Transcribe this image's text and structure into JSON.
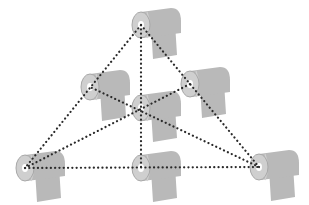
{
  "diagram": {
    "title": "",
    "colors": {
      "background": "#ffffff",
      "roll": "#b9b9b9",
      "roll_edge": "#a8a8a8",
      "roll_face": "#cfcfcf",
      "core": "#ffffff",
      "dots": "#2a2a2a"
    },
    "nodes": [
      {
        "id": "top",
        "role": "vertex",
        "x": 141,
        "y": 25
      },
      {
        "id": "left-mid",
        "role": "midpoint",
        "x": 90,
        "y": 87
      },
      {
        "id": "right-mid",
        "role": "midpoint",
        "x": 190,
        "y": 84
      },
      {
        "id": "center",
        "role": "centroid",
        "x": 141,
        "y": 108
      },
      {
        "id": "bottom-left",
        "role": "vertex",
        "x": 25,
        "y": 168
      },
      {
        "id": "bottom-mid",
        "role": "midpoint",
        "x": 141,
        "y": 168
      },
      {
        "id": "bottom-right",
        "role": "vertex",
        "x": 259,
        "y": 167
      }
    ],
    "edges": [
      {
        "from": "top",
        "to": "bottom-left"
      },
      {
        "from": "top",
        "to": "bottom-right"
      },
      {
        "from": "bottom-left",
        "to": "bottom-right"
      },
      {
        "from": "top",
        "to": "bottom-mid"
      },
      {
        "from": "bottom-left",
        "to": "right-mid"
      },
      {
        "from": "bottom-right",
        "to": "left-mid"
      }
    ]
  }
}
